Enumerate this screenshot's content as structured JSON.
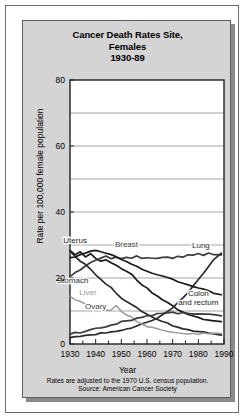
{
  "chart_data": {
    "type": "line",
    "title": "Cancer Death Rates Site, Females 1930-89",
    "title_lines": [
      "Cancer Death Rates Site,",
      "Females",
      "1930-89"
    ],
    "xlabel": "Year",
    "ylabel": "Rate per 100,000 female population",
    "xlim": [
      1930,
      1990
    ],
    "ylim": [
      0,
      80
    ],
    "ytick_labels": [
      "0",
      "20",
      "40",
      "60",
      "80"
    ],
    "ytick_values": [
      0,
      20,
      40,
      60,
      80
    ],
    "xtick_labels": [
      "1930",
      "1940",
      "1950",
      "1960",
      "1970",
      "1980",
      "1990"
    ],
    "xtick_values": [
      1930,
      1940,
      1950,
      1960,
      1970,
      1980,
      1990
    ],
    "gridlines": [
      10,
      20,
      30,
      40,
      50,
      60,
      70
    ],
    "grid": true,
    "legend": "inline-labels",
    "x": [
      1930,
      1932,
      1934,
      1936,
      1938,
      1940,
      1942,
      1944,
      1946,
      1948,
      1950,
      1952,
      1954,
      1956,
      1958,
      1960,
      1962,
      1964,
      1966,
      1968,
      1970,
      1972,
      1974,
      1976,
      1978,
      1980,
      1982,
      1984,
      1986,
      1989
    ],
    "series": [
      {
        "name": "Uterus",
        "color": "#1a1a1a",
        "label_x": 1932,
        "label_y": 30.5,
        "values": [
          28.5,
          27.0,
          28.0,
          26.5,
          27.5,
          26.0,
          25.0,
          25.5,
          24.5,
          24.0,
          23.0,
          22.0,
          21.0,
          19.5,
          18.0,
          17.0,
          15.5,
          14.5,
          13.5,
          12.5,
          11.5,
          10.5,
          9.5,
          9.0,
          8.5,
          8.0,
          7.5,
          7.2,
          7.0,
          6.8
        ]
      },
      {
        "name": "Breast",
        "color": "#3c3c3c",
        "label_x": 1952,
        "label_y": 29.5,
        "values": [
          20.5,
          21.5,
          22.5,
          23.5,
          24.5,
          25.5,
          26.0,
          26.5,
          26.0,
          26.5,
          26.0,
          26.5,
          26.0,
          26.5,
          26.0,
          26.2,
          25.8,
          26.2,
          26.0,
          26.5,
          26.2,
          26.8,
          26.5,
          27.0,
          26.8,
          27.2,
          27.0,
          27.5,
          27.2,
          27.0
        ]
      },
      {
        "name": "Lung",
        "color": "#2b2b2b",
        "label_x": 1981,
        "label_y": 29.0,
        "values": [
          2.0,
          2.2,
          2.4,
          2.6,
          2.8,
          3.0,
          3.2,
          3.4,
          3.6,
          3.8,
          4.2,
          4.6,
          5.0,
          5.4,
          6.0,
          6.5,
          7.2,
          8.0,
          8.8,
          9.8,
          11.0,
          12.5,
          14.0,
          15.5,
          17.5,
          19.5,
          21.5,
          23.5,
          25.5,
          27.5
        ]
      },
      {
        "name": "Stomach",
        "color": "#2b2b2b",
        "label_x": 1931,
        "label_y": 18.5,
        "values": [
          28.0,
          26.5,
          25.0,
          24.0,
          22.5,
          21.0,
          19.5,
          18.0,
          17.0,
          15.5,
          14.0,
          13.0,
          12.0,
          11.0,
          10.0,
          9.0,
          8.2,
          7.5,
          6.8,
          6.2,
          5.5,
          5.0,
          4.5,
          4.2,
          4.0,
          3.8,
          3.5,
          3.2,
          3.0,
          2.8
        ]
      },
      {
        "name": "Liver",
        "color": "#9a9a9a",
        "label_x": 1937,
        "label_y": 15.0,
        "values": [
          14.5,
          13.5,
          13.0,
          12.0,
          11.5,
          11.0,
          10.5,
          10.0,
          10.5,
          11.5,
          10.0,
          9.0,
          8.0,
          7.0,
          6.2,
          5.5,
          5.0,
          4.5,
          4.0,
          3.6,
          3.4,
          3.2,
          3.0,
          3.0,
          3.0,
          3.0,
          3.1,
          3.2,
          3.2,
          3.2
        ]
      },
      {
        "name": "Ovary",
        "color": "#3c3c3c",
        "label_x": 1940,
        "label_y": 10.5,
        "values": [
          3.0,
          3.3,
          3.6,
          4.0,
          4.3,
          4.7,
          5.0,
          5.4,
          5.8,
          6.2,
          6.6,
          7.0,
          7.4,
          7.8,
          8.2,
          8.5,
          8.8,
          9.0,
          9.2,
          9.4,
          9.4,
          9.4,
          9.3,
          9.2,
          9.1,
          9.0,
          8.9,
          8.8,
          8.7,
          8.6
        ]
      },
      {
        "name": "Colon and rectum",
        "color": "#1a1a1a",
        "label_x": 1980,
        "label_y": 14.5,
        "label_lines": [
          "Colon",
          "and rectum"
        ],
        "values": [
          26.0,
          26.5,
          27.0,
          27.5,
          28.0,
          28.5,
          28.0,
          27.5,
          27.0,
          26.5,
          25.5,
          25.0,
          24.0,
          23.5,
          22.5,
          22.0,
          21.5,
          21.0,
          20.5,
          20.0,
          19.5,
          19.0,
          18.5,
          18.0,
          17.5,
          17.0,
          16.5,
          16.0,
          15.5,
          15.0
        ]
      }
    ],
    "footnote_lines": [
      "Rates are adjusted to the 1970 U.S. census population.",
      "Source: American Cancer Society"
    ]
  }
}
